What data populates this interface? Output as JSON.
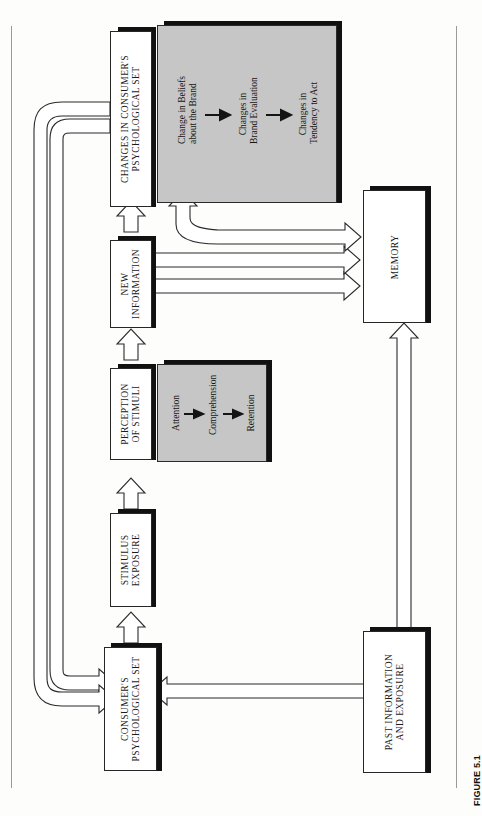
{
  "figure": {
    "caption": "FIGURE 5.1",
    "orientation": "rotated-90-ccw",
    "page_bg": "#fdfdfc",
    "panel_fill": "#c6c6c6",
    "line_color": "#262626"
  },
  "nodes": {
    "changes_set": {
      "id": "changes-in-consumers-psychological-set",
      "line1": "CHANGES IN CONSUMER'S",
      "line2": "PSYCHOLOGICAL SET"
    },
    "new_information": {
      "id": "new-information",
      "line1": "NEW",
      "line2": "INFORMATION"
    },
    "perception": {
      "id": "perception-of-stimuli",
      "line1": "PERCEPTION",
      "line2": "OF STIMULI"
    },
    "stimulus_exposure": {
      "id": "stimulus-exposure",
      "line1": "STIMULUS",
      "line2": "EXPOSURE"
    },
    "consumer_set": {
      "id": "consumers-psychological-set",
      "line1": "CONSUMER'S",
      "line2": "PSYCHOLOGICAL SET"
    },
    "memory": {
      "id": "memory",
      "line1": "MEMORY",
      "line2": ""
    },
    "past_information": {
      "id": "past-information-and-exposure",
      "line1": "PAST INFORMATION",
      "line2": "AND EXPOSURE"
    }
  },
  "panels": {
    "changes_detail": {
      "id": "changes-detail-panel",
      "steps": [
        {
          "line1": "Change in Beliefs",
          "line2": "about the Brand"
        },
        {
          "line1": "Changes in",
          "line2": "Brand Evaluation"
        },
        {
          "line1": "Changes in",
          "line2": "Tendency to Act"
        }
      ]
    },
    "perception_detail": {
      "id": "perception-detail-panel",
      "steps": [
        {
          "line1": "Attention",
          "line2": ""
        },
        {
          "line1": "Comprehension",
          "line2": ""
        },
        {
          "line1": "Retention",
          "line2": ""
        }
      ]
    }
  },
  "flows": [
    {
      "from": "consumer_set",
      "to": "stimulus_exposure",
      "style": "hollow-arrow"
    },
    {
      "from": "stimulus_exposure",
      "to": "perception",
      "style": "hollow-arrow"
    },
    {
      "from": "perception",
      "to": "new_information",
      "style": "hollow-arrow"
    },
    {
      "from": "new_information",
      "to": "changes_set",
      "style": "hollow-arrow"
    },
    {
      "from": "new_information",
      "to": "memory",
      "style": "hollow-arrow"
    },
    {
      "from": "memory",
      "to": "changes_set",
      "style": "hollow-arrow-curved"
    },
    {
      "from": "changes_set",
      "to": "memory",
      "style": "hollow-arrow"
    },
    {
      "from": "past_information",
      "to": "memory",
      "style": "hollow-arrow"
    },
    {
      "from": "past_information",
      "to": "consumer_set",
      "style": "hollow-arrow"
    },
    {
      "from": "changes_set",
      "to": "consumer_set",
      "style": "hollow-arrow-feedback"
    },
    {
      "from": "changes_set",
      "to": "consumer_set",
      "style": "hollow-arrow-feedback-outer"
    }
  ]
}
